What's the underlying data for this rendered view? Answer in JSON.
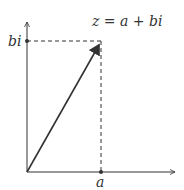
{
  "diagram": {
    "title_label": "z = a + bi",
    "x_label": "a",
    "y_label": "bi",
    "colors": {
      "stroke": "#333333",
      "background": "#ffffff"
    }
  }
}
